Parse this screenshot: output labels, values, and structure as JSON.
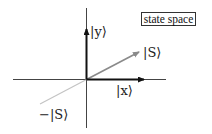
{
  "diagram": {
    "title_box": "state space",
    "labels": {
      "y_basis": "|y⟩",
      "x_basis": "|x⟩",
      "state": "|S⟩",
      "neg_state": "−|S⟩"
    },
    "colors": {
      "axis": "#333333",
      "basis_arrow": "#111111",
      "state_arrow": "#8a8a8a",
      "neg_state_line": "#bdbdbd"
    }
  }
}
